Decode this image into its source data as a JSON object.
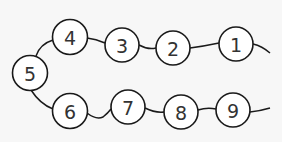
{
  "diagram": {
    "type": "number-chain",
    "colors": {
      "background": "#f7f7f7",
      "stroke": "#1a1a1a",
      "node_fill": "#ffffff",
      "text": "#333333"
    },
    "nodes": [
      {
        "label": "1",
        "cx": 236,
        "cy": 44
      },
      {
        "label": "2",
        "cx": 173,
        "cy": 48
      },
      {
        "label": "3",
        "cx": 122,
        "cy": 45
      },
      {
        "label": "4",
        "cx": 70,
        "cy": 37
      },
      {
        "label": "5",
        "cx": 30,
        "cy": 73
      },
      {
        "label": "6",
        "cx": 70,
        "cy": 111
      },
      {
        "label": "7",
        "cx": 128,
        "cy": 107
      },
      {
        "label": "8",
        "cx": 181,
        "cy": 112
      },
      {
        "label": "9",
        "cx": 233,
        "cy": 110
      }
    ]
  }
}
